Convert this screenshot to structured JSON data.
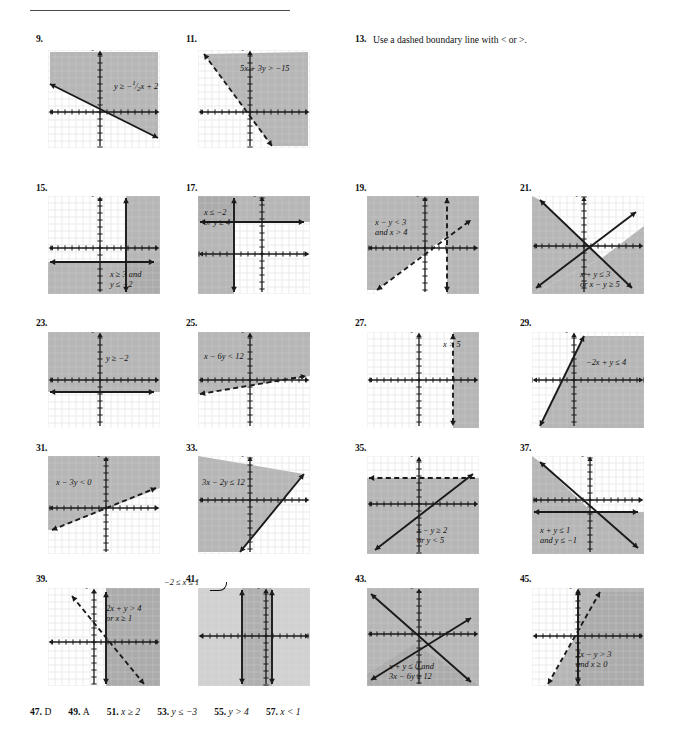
{
  "page": {
    "width": 681,
    "height": 731,
    "type": "textbook-answer-key",
    "grid_fill": "#ffffff",
    "grid_line": "#e2e2e2",
    "shade_fill": "#a9a9a9",
    "shade_fill_light": "#c9c9c9",
    "axis_color": "#1a1a1a"
  },
  "answers_line": {
    "items": [
      {
        "num": "47.",
        "text": "D"
      },
      {
        "num": "49.",
        "text": "A"
      },
      {
        "num": "51.",
        "text": "x ≥ 2"
      },
      {
        "num": "53.",
        "text": "y ≤ −3"
      },
      {
        "num": "55.",
        "text": "y > 4"
      },
      {
        "num": "57.",
        "text": "x < 1"
      }
    ]
  },
  "problems": [
    {
      "id": "p9",
      "num": "9.",
      "kind": "graph",
      "x": 36,
      "y": 34,
      "box_x": 48,
      "box_y": 50,
      "box_w": 112,
      "box_h": 98,
      "axis_x_label": "x",
      "axis_y_label": "y",
      "label": "y ≥ −½x + 2",
      "label_html": "y ≥ −<sup>1</sup>⁄<sub>2</sub>x + 2",
      "label_x": 66,
      "label_y": 28,
      "origin_x": 52,
      "origin_y": 62,
      "shade": "above-line",
      "lines": [
        {
          "style": "solid",
          "x1": 2,
          "y1": 34,
          "x2": 110,
          "y2": 88,
          "arrows": "both"
        }
      ],
      "shade_poly": "2,34 110,88 110,2 2,2"
    },
    {
      "id": "p11",
      "num": "11.",
      "kind": "graph",
      "x": 186,
      "y": 34,
      "box_x": 198,
      "box_y": 50,
      "box_w": 112,
      "box_h": 98,
      "axis_x_label": "x",
      "axis_y_label": "y",
      "label": "5x + 3y > −15",
      "label_x": 42,
      "label_y": 14,
      "origin_x": 52,
      "origin_y": 62,
      "shade": "right-of-line",
      "lines": [
        {
          "style": "dashed",
          "x1": 6,
          "y1": 4,
          "x2": 74,
          "y2": 96,
          "arrows": "both"
        }
      ],
      "shade_poly": "6,4 74,96 110,96 110,2"
    },
    {
      "id": "p13",
      "num": "13.",
      "kind": "text",
      "x": 355,
      "y": 34,
      "text": "Use a dashed boundary line with < or >."
    },
    {
      "id": "p15",
      "num": "15.",
      "kind": "graph",
      "x": 36,
      "y": 183,
      "box_x": 48,
      "box_y": 196,
      "box_w": 112,
      "box_h": 98,
      "axis_x_label": "x",
      "axis_y_label": "y",
      "label": "x ≥ 3 and",
      "label2": "y ≤ −2",
      "label_x": 62,
      "label_y": 74,
      "origin_x": 52,
      "origin_y": 52,
      "shade": "quadrant-strip",
      "lines": [
        {
          "style": "solid",
          "x1": 78,
          "y1": 2,
          "x2": 78,
          "y2": 96,
          "arrows": "both"
        },
        {
          "style": "solid",
          "x1": 2,
          "y1": 66,
          "x2": 106,
          "y2": 66,
          "arrows": "both"
        }
      ],
      "shade_rects": [
        {
          "x": 0,
          "y": 66,
          "w": 112,
          "h": 32,
          "tone": "mid"
        },
        {
          "x": 78,
          "y": 0,
          "w": 34,
          "h": 98,
          "tone": "mid"
        }
      ]
    },
    {
      "id": "p17",
      "num": "17.",
      "kind": "graph",
      "x": 186,
      "y": 183,
      "box_x": 198,
      "box_y": 196,
      "box_w": 112,
      "box_h": 98,
      "axis_x_label": "x",
      "axis_y_label": "y",
      "label": "x ≤ −2",
      "label2": "or y ≥ 4",
      "label_x": 6,
      "label_y": 12,
      "origin_x": 64,
      "origin_y": 58,
      "shade": "union",
      "lines": [
        {
          "style": "solid",
          "x1": 36,
          "y1": 2,
          "x2": 36,
          "y2": 96,
          "arrows": "both"
        },
        {
          "style": "solid",
          "x1": 2,
          "y1": 26,
          "x2": 106,
          "y2": 26,
          "arrows": "both"
        }
      ],
      "shade_rects": [
        {
          "x": 0,
          "y": 0,
          "w": 112,
          "h": 26,
          "tone": "mid"
        },
        {
          "x": 0,
          "y": 0,
          "w": 36,
          "h": 98,
          "tone": "mid"
        }
      ]
    },
    {
      "id": "p19",
      "num": "19.",
      "kind": "graph",
      "x": 355,
      "y": 183,
      "box_x": 367,
      "box_y": 196,
      "box_w": 112,
      "box_h": 98,
      "axis_x_label": "x",
      "axis_y_label": "y",
      "label": "x − y < 3",
      "label2": "and x > 4",
      "label_x": 8,
      "label_y": 22,
      "origin_x": 58,
      "origin_y": 52,
      "shade": "intersection-complement",
      "lines": [
        {
          "style": "dashed",
          "x1": 10,
          "y1": 94,
          "x2": 104,
          "y2": 24,
          "arrows": "both"
        },
        {
          "style": "dashed",
          "x1": 80,
          "y1": 2,
          "x2": 80,
          "y2": 96,
          "arrows": "both"
        }
      ],
      "shade_poly": "0,0 112,0 112,98 80,98 80,40 10,94 0,94",
      "white_poly": "10,94 80,40 80,98 10,98"
    },
    {
      "id": "p21",
      "num": "21.",
      "kind": "graph",
      "x": 520,
      "y": 183,
      "box_x": 532,
      "box_y": 196,
      "box_w": 112,
      "box_h": 98,
      "axis_x_label": "x",
      "axis_y_label": "y",
      "label": "x + y ≤ 3",
      "label2": "or x − y ≥ 5",
      "label_x": 48,
      "label_y": 74,
      "origin_x": 52,
      "origin_y": 50,
      "shade": "union-wedges",
      "lines": [
        {
          "style": "solid",
          "x1": 8,
          "y1": 4,
          "x2": 100,
          "y2": 92,
          "arrows": "both"
        },
        {
          "style": "solid",
          "x1": 4,
          "y1": 92,
          "x2": 104,
          "y2": 16,
          "arrows": "both"
        }
      ],
      "shade_poly_a": "0,0 8,4 70,62 0,98",
      "shade_poly_b": "70,62 112,30 112,98 0,98"
    },
    {
      "id": "p23",
      "num": "23.",
      "kind": "graph",
      "x": 36,
      "y": 318,
      "box_x": 48,
      "box_y": 332,
      "box_w": 112,
      "box_h": 96,
      "axis_x_label": "x",
      "axis_y_label": "y",
      "label": "y ≥ −2",
      "label_x": 58,
      "label_y": 22,
      "origin_x": 52,
      "origin_y": 48,
      "shade": "above-horizontal",
      "lines": [
        {
          "style": "solid",
          "x1": 2,
          "y1": 60,
          "x2": 106,
          "y2": 60,
          "arrows": "both"
        }
      ],
      "shade_rects": [
        {
          "x": 0,
          "y": 0,
          "w": 112,
          "h": 60,
          "tone": "mid"
        }
      ]
    },
    {
      "id": "p25",
      "num": "25.",
      "kind": "graph",
      "x": 186,
      "y": 318,
      "box_x": 198,
      "box_y": 332,
      "box_w": 112,
      "box_h": 96,
      "axis_x_label": "x",
      "axis_y_label": "y",
      "label": "x − 6y < 12",
      "label_x": 6,
      "label_y": 20,
      "origin_x": 52,
      "origin_y": 48,
      "shade": "above-line",
      "lines": [
        {
          "style": "dashed",
          "x1": 2,
          "y1": 62,
          "x2": 108,
          "y2": 44,
          "arrows": "both"
        }
      ],
      "shade_poly": "0,0 112,0 112,44 2,62 0,62"
    },
    {
      "id": "p27",
      "num": "27.",
      "kind": "graph",
      "x": 355,
      "y": 318,
      "box_x": 367,
      "box_y": 332,
      "box_w": 112,
      "box_h": 96,
      "axis_x_label": "x",
      "axis_y_label": "y",
      "label": "x > 5",
      "label_x": 76,
      "label_y": 8,
      "origin_x": 52,
      "origin_y": 48,
      "shade": "right-of-vertical",
      "lines": [
        {
          "style": "dashed",
          "x1": 86,
          "y1": 2,
          "x2": 86,
          "y2": 94,
          "arrows": "both"
        }
      ],
      "shade_rects": [
        {
          "x": 86,
          "y": 0,
          "w": 26,
          "h": 96,
          "tone": "mid"
        }
      ]
    },
    {
      "id": "p29",
      "num": "29.",
      "kind": "graph",
      "x": 520,
      "y": 318,
      "box_x": 532,
      "box_y": 332,
      "box_w": 112,
      "box_h": 96,
      "axis_x_label": "x",
      "axis_y_label": "y",
      "label": "−2x + y ≤ 4",
      "label_x": 54,
      "label_y": 26,
      "origin_x": 42,
      "origin_y": 48,
      "shade": "right-of-line",
      "lines": [
        {
          "style": "solid",
          "x1": 8,
          "y1": 94,
          "x2": 52,
          "y2": 4,
          "arrows": "both"
        }
      ],
      "shade_poly": "52,4 112,4 112,96 8,96"
    },
    {
      "id": "p31",
      "num": "31.",
      "kind": "graph",
      "x": 36,
      "y": 443,
      "box_x": 48,
      "box_y": 456,
      "box_w": 112,
      "box_h": 98,
      "axis_x_label": "x",
      "axis_y_label": "y",
      "label": "x − 3y < 0",
      "label_x": 8,
      "label_y": 22,
      "origin_x": 58,
      "origin_y": 52,
      "shade": "above-line",
      "lines": [
        {
          "style": "dashed",
          "x1": 4,
          "y1": 74,
          "x2": 108,
          "y2": 32,
          "arrows": "both"
        }
      ],
      "shade_poly": "0,0 112,0 112,32 4,74 0,74"
    },
    {
      "id": "p33",
      "num": "33.",
      "kind": "graph",
      "x": 186,
      "y": 443,
      "box_x": 198,
      "box_y": 456,
      "box_w": 112,
      "box_h": 98,
      "axis_x_label": "x",
      "axis_y_label": "y",
      "label": "3x − 2y ≤ 12",
      "label_x": 4,
      "label_y": 22,
      "origin_x": 52,
      "origin_y": 44,
      "shade": "left-of-line",
      "lines": [
        {
          "style": "solid",
          "x1": 42,
          "y1": 96,
          "x2": 106,
          "y2": 18,
          "arrows": "both"
        }
      ],
      "shade_poly": "0,0 106,18 42,96 0,96"
    },
    {
      "id": "p35",
      "num": "35.",
      "kind": "graph",
      "x": 355,
      "y": 443,
      "box_x": 367,
      "box_y": 456,
      "box_w": 112,
      "box_h": 98,
      "axis_x_label": "x",
      "axis_y_label": "y",
      "label": "x − y ≥ 2",
      "label2": "or y < 5",
      "label_x": 50,
      "label_y": 70,
      "origin_x": 52,
      "origin_y": 48,
      "shade": "union-below",
      "lines": [
        {
          "style": "dashed",
          "x1": 2,
          "y1": 22,
          "x2": 108,
          "y2": 22,
          "arrows": "left"
        },
        {
          "style": "solid",
          "x1": 8,
          "y1": 94,
          "x2": 106,
          "y2": 18,
          "arrows": "both"
        }
      ],
      "shade_rects": [
        {
          "x": 0,
          "y": 22,
          "w": 112,
          "h": 76,
          "tone": "mid"
        }
      ]
    },
    {
      "id": "p37",
      "num": "37.",
      "kind": "graph",
      "x": 520,
      "y": 443,
      "box_x": 532,
      "box_y": 456,
      "box_w": 112,
      "box_h": 98,
      "axis_x_label": "x",
      "axis_y_label": "y",
      "label": "x + y ≤ 1",
      "label2": "and y ≤ −1",
      "label_x": 8,
      "label_y": 70,
      "origin_x": 58,
      "origin_y": 44,
      "shade": "intersection-below",
      "lines": [
        {
          "style": "solid",
          "x1": 8,
          "y1": 6,
          "x2": 106,
          "y2": 92,
          "arrows": "both"
        },
        {
          "style": "solid",
          "x1": 2,
          "y1": 56,
          "x2": 106,
          "y2": 56,
          "arrows": "both"
        }
      ],
      "shade_poly": "0,0 8,6 60,56 0,56",
      "shade_poly2": "0,56 112,56 112,98 0,98"
    },
    {
      "id": "p39",
      "num": "39.",
      "kind": "graph",
      "x": 36,
      "y": 574,
      "box_x": 48,
      "box_y": 588,
      "box_w": 112,
      "box_h": 98,
      "axis_x_label": "x",
      "axis_y_label": "y",
      "label": "2x + y > 4",
      "label2": "or x ≥ 1",
      "label_x": 58,
      "label_y": 16,
      "origin_x": 46,
      "origin_y": 54,
      "shade": "union-right",
      "lines": [
        {
          "style": "dashed",
          "x1": 24,
          "y1": 8,
          "x2": 96,
          "y2": 96,
          "arrows": "both"
        },
        {
          "style": "solid",
          "x1": 58,
          "y1": 4,
          "x2": 58,
          "y2": 96,
          "arrows": "both"
        }
      ],
      "shade_poly": "24,8 58,48 58,0 112,0 112,98 58,98 58,48",
      "shade_rects": [
        {
          "x": 58,
          "y": 0,
          "w": 54,
          "h": 98,
          "tone": "mid"
        }
      ]
    },
    {
      "id": "p41",
      "num": "41.",
      "kind": "graph",
      "x": 186,
      "y": 574,
      "box_x": 198,
      "box_y": 588,
      "box_w": 112,
      "box_h": 98,
      "axis_x_label": "x",
      "axis_y_label": "y",
      "label": "−2 ≤ x ≤ 1",
      "label_x": -34,
      "label_y": -10,
      "leader": true,
      "origin_x": 68,
      "origin_y": 48,
      "shade": "vertical-strip",
      "lines": [
        {
          "style": "solid",
          "x1": 44,
          "y1": 2,
          "x2": 44,
          "y2": 96,
          "arrows": "both"
        },
        {
          "style": "solid",
          "x1": 74,
          "y1": 2,
          "x2": 74,
          "y2": 96,
          "arrows": "both"
        }
      ],
      "shade_rects": [
        {
          "x": 0,
          "y": 0,
          "w": 112,
          "h": 98,
          "tone": "light"
        },
        {
          "x": 44,
          "y": 0,
          "w": 30,
          "h": 98,
          "tone": "mid"
        }
      ]
    },
    {
      "id": "p43",
      "num": "43.",
      "kind": "graph",
      "x": 355,
      "y": 574,
      "box_x": 367,
      "box_y": 588,
      "box_w": 112,
      "box_h": 98,
      "axis_x_label": "x",
      "axis_y_label": "y",
      "label": "x + y ≤ 0 and",
      "label2": "3x − 6y ≥ 12",
      "label_x": 22,
      "label_y": 74,
      "origin_x": 52,
      "origin_y": 46,
      "shade": "intersection-wedge",
      "lines": [
        {
          "style": "solid",
          "x1": 4,
          "y1": 6,
          "x2": 104,
          "y2": 94,
          "arrows": "both"
        },
        {
          "style": "solid",
          "x1": 4,
          "y1": 92,
          "x2": 104,
          "y2": 30,
          "arrows": "both"
        }
      ],
      "shade_poly": "0,0 112,0 112,98 0,98",
      "shade_poly2": "48,56 112,98 0,98 0,86"
    },
    {
      "id": "p45",
      "num": "45.",
      "kind": "graph",
      "x": 520,
      "y": 574,
      "box_x": 532,
      "box_y": 588,
      "box_w": 112,
      "box_h": 98,
      "axis_x_label": "x",
      "axis_y_label": "y",
      "label": "2x − y > 3",
      "label2": "and x ≥ 0",
      "label_x": 44,
      "label_y": 62,
      "origin_x": 46,
      "origin_y": 48,
      "shade": "wedge-right",
      "lines": [
        {
          "style": "dashed",
          "x1": 16,
          "y1": 96,
          "x2": 68,
          "y2": 4,
          "arrows": "both"
        },
        {
          "style": "solid",
          "x1": 46,
          "y1": 2,
          "x2": 46,
          "y2": 96,
          "arrows": "both"
        }
      ],
      "shade_poly": "46,0 112,0 112,98 46,98",
      "shade_poly2": "68,4 112,4 112,98 16,98"
    }
  ]
}
